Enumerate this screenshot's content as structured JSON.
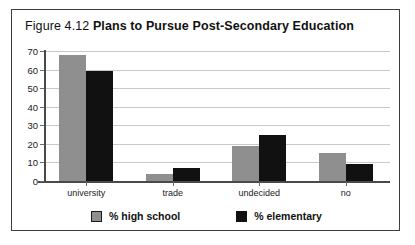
{
  "figure": {
    "number": "Figure 4.12",
    "name": "Plans to Pursue Post-Secondary Education"
  },
  "chart_data": {
    "type": "bar",
    "title": "Plans to Pursue Post-Secondary Education",
    "categories": [
      "university",
      "trade",
      "undecided",
      "no"
    ],
    "series": [
      {
        "name": "% high school",
        "color": "#8f8f8f",
        "values": [
          68,
          4,
          19,
          15
        ]
      },
      {
        "name": "% elementary",
        "color": "#111111",
        "values": [
          59,
          7,
          25,
          9
        ]
      }
    ],
    "xlabel": "",
    "ylabel": "",
    "ylim": [
      0,
      70
    ],
    "yticks": [
      0,
      10,
      20,
      30,
      40,
      50,
      60,
      70
    ],
    "ytick_labels": [
      "0",
      "10",
      "20",
      "30",
      "40",
      "50",
      "60",
      "70"
    ],
    "grid": true,
    "legend_position": "bottom"
  }
}
